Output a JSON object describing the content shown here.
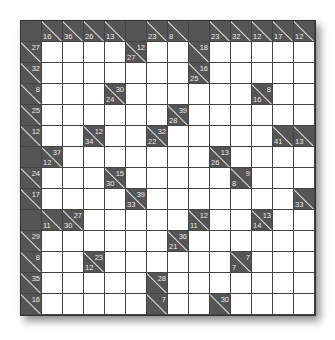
{
  "puzzle": {
    "type": "kakuro",
    "rows": 14,
    "cols": 14,
    "cells": [
      [
        {
          "t": "B"
        },
        {
          "t": "C",
          "d": "16"
        },
        {
          "t": "C",
          "d": "36"
        },
        {
          "t": "C",
          "d": "26"
        },
        {
          "t": "C",
          "d": "13"
        },
        {
          "t": "B"
        },
        {
          "t": "C",
          "d": "23"
        },
        {
          "t": "C",
          "d": "8"
        },
        {
          "t": "B"
        },
        {
          "t": "C",
          "d": "23"
        },
        {
          "t": "C",
          "d": "32"
        },
        {
          "t": "C",
          "d": "12"
        },
        {
          "t": "C",
          "d": "17"
        },
        {
          "t": "C",
          "d": "12"
        }
      ],
      [
        {
          "t": "C",
          "r": "27"
        },
        {
          "t": "W"
        },
        {
          "t": "W"
        },
        {
          "t": "W"
        },
        {
          "t": "W"
        },
        {
          "t": "C",
          "d": "27",
          "r": "12"
        },
        {
          "t": "W"
        },
        {
          "t": "W"
        },
        {
          "t": "C",
          "r": "18"
        },
        {
          "t": "W"
        },
        {
          "t": "W"
        },
        {
          "t": "W"
        },
        {
          "t": "W"
        },
        {
          "t": "W"
        }
      ],
      [
        {
          "t": "C",
          "r": "32"
        },
        {
          "t": "W"
        },
        {
          "t": "W"
        },
        {
          "t": "W"
        },
        {
          "t": "W"
        },
        {
          "t": "W"
        },
        {
          "t": "W"
        },
        {
          "t": "W"
        },
        {
          "t": "C",
          "d": "25",
          "r": "16"
        },
        {
          "t": "W"
        },
        {
          "t": "W"
        },
        {
          "t": "W"
        },
        {
          "t": "W"
        },
        {
          "t": "W"
        }
      ],
      [
        {
          "t": "C",
          "r": "8"
        },
        {
          "t": "W"
        },
        {
          "t": "W"
        },
        {
          "t": "W"
        },
        {
          "t": "C",
          "d": "24",
          "r": "30"
        },
        {
          "t": "W"
        },
        {
          "t": "W"
        },
        {
          "t": "W"
        },
        {
          "t": "W"
        },
        {
          "t": "W"
        },
        {
          "t": "W"
        },
        {
          "t": "C",
          "d": "16",
          "r": "8"
        },
        {
          "t": "W"
        },
        {
          "t": "W"
        }
      ],
      [
        {
          "t": "C",
          "r": "25"
        },
        {
          "t": "W"
        },
        {
          "t": "W"
        },
        {
          "t": "W"
        },
        {
          "t": "W"
        },
        {
          "t": "W"
        },
        {
          "t": "W"
        },
        {
          "t": "C",
          "d": "28",
          "r": "39"
        },
        {
          "t": "W"
        },
        {
          "t": "W"
        },
        {
          "t": "W"
        },
        {
          "t": "W"
        },
        {
          "t": "W"
        },
        {
          "t": "W"
        }
      ],
      [
        {
          "t": "C",
          "r": "12"
        },
        {
          "t": "W"
        },
        {
          "t": "W"
        },
        {
          "t": "C",
          "d": "34",
          "r": "12"
        },
        {
          "t": "W"
        },
        {
          "t": "W"
        },
        {
          "t": "C",
          "d": "22",
          "r": "32"
        },
        {
          "t": "W"
        },
        {
          "t": "W"
        },
        {
          "t": "W"
        },
        {
          "t": "W"
        },
        {
          "t": "W"
        },
        {
          "t": "C",
          "d": "41"
        },
        {
          "t": "C",
          "d": "13"
        }
      ],
      [
        {
          "t": "B"
        },
        {
          "t": "C",
          "d": "12",
          "r": "37"
        },
        {
          "t": "W"
        },
        {
          "t": "W"
        },
        {
          "t": "W"
        },
        {
          "t": "W"
        },
        {
          "t": "W"
        },
        {
          "t": "W"
        },
        {
          "t": "W"
        },
        {
          "t": "C",
          "d": "26",
          "r": "13"
        },
        {
          "t": "W"
        },
        {
          "t": "W"
        },
        {
          "t": "W"
        },
        {
          "t": "W"
        }
      ],
      [
        {
          "t": "C",
          "r": "24"
        },
        {
          "t": "W"
        },
        {
          "t": "W"
        },
        {
          "t": "W"
        },
        {
          "t": "C",
          "d": "30",
          "r": "15"
        },
        {
          "t": "W"
        },
        {
          "t": "W"
        },
        {
          "t": "W"
        },
        {
          "t": "W"
        },
        {
          "t": "W"
        },
        {
          "t": "C",
          "d": "8",
          "r": "9"
        },
        {
          "t": "W"
        },
        {
          "t": "W"
        },
        {
          "t": "W"
        }
      ],
      [
        {
          "t": "C",
          "r": "17"
        },
        {
          "t": "W"
        },
        {
          "t": "W"
        },
        {
          "t": "W"
        },
        {
          "t": "W"
        },
        {
          "t": "C",
          "d": "33",
          "r": "39"
        },
        {
          "t": "W"
        },
        {
          "t": "W"
        },
        {
          "t": "W"
        },
        {
          "t": "W"
        },
        {
          "t": "W"
        },
        {
          "t": "W"
        },
        {
          "t": "W"
        },
        {
          "t": "C",
          "d": "33"
        }
      ],
      [
        {
          "t": "B"
        },
        {
          "t": "C",
          "d": "11"
        },
        {
          "t": "C",
          "d": "30",
          "r": "27"
        },
        {
          "t": "W"
        },
        {
          "t": "W"
        },
        {
          "t": "W"
        },
        {
          "t": "W"
        },
        {
          "t": "W"
        },
        {
          "t": "C",
          "d": "11",
          "r": "12"
        },
        {
          "t": "W"
        },
        {
          "t": "W"
        },
        {
          "t": "C",
          "d": "14",
          "r": "13"
        },
        {
          "t": "W"
        },
        {
          "t": "W"
        }
      ],
      [
        {
          "t": "C",
          "r": "29"
        },
        {
          "t": "W"
        },
        {
          "t": "W"
        },
        {
          "t": "W"
        },
        {
          "t": "W"
        },
        {
          "t": "W"
        },
        {
          "t": "W"
        },
        {
          "t": "C",
          "d": "21",
          "r": "36"
        },
        {
          "t": "W"
        },
        {
          "t": "W"
        },
        {
          "t": "W"
        },
        {
          "t": "W"
        },
        {
          "t": "W"
        },
        {
          "t": "W"
        }
      ],
      [
        {
          "t": "C",
          "r": "8"
        },
        {
          "t": "W"
        },
        {
          "t": "W"
        },
        {
          "t": "C",
          "d": "12",
          "r": "23"
        },
        {
          "t": "W"
        },
        {
          "t": "W"
        },
        {
          "t": "W"
        },
        {
          "t": "W"
        },
        {
          "t": "W"
        },
        {
          "t": "W"
        },
        {
          "t": "C",
          "d": "7",
          "r": "7"
        },
        {
          "t": "W"
        },
        {
          "t": "W"
        },
        {
          "t": "W"
        }
      ],
      [
        {
          "t": "C",
          "r": "35"
        },
        {
          "t": "W"
        },
        {
          "t": "W"
        },
        {
          "t": "W"
        },
        {
          "t": "W"
        },
        {
          "t": "W"
        },
        {
          "t": "C",
          "r": "28"
        },
        {
          "t": "W"
        },
        {
          "t": "W"
        },
        {
          "t": "W"
        },
        {
          "t": "W"
        },
        {
          "t": "W"
        },
        {
          "t": "W"
        },
        {
          "t": "W"
        }
      ],
      [
        {
          "t": "C",
          "r": "16"
        },
        {
          "t": "W"
        },
        {
          "t": "W"
        },
        {
          "t": "W"
        },
        {
          "t": "W"
        },
        {
          "t": "W"
        },
        {
          "t": "C",
          "r": "7"
        },
        {
          "t": "W"
        },
        {
          "t": "W"
        },
        {
          "t": "C",
          "r": "30"
        },
        {
          "t": "W"
        },
        {
          "t": "W"
        },
        {
          "t": "W"
        },
        {
          "t": "W"
        }
      ]
    ]
  }
}
